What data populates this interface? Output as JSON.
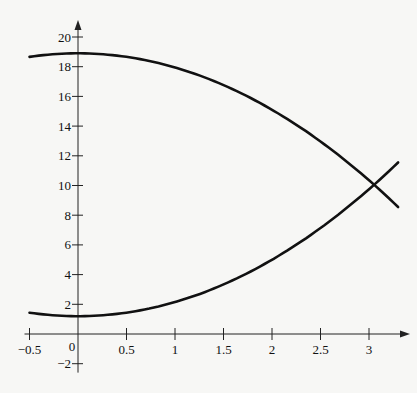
{
  "chart_data": {
    "type": "line",
    "title": "",
    "xlabel": "",
    "ylabel": "",
    "xlim": [
      -0.5,
      3.3
    ],
    "ylim": [
      -2,
      20
    ],
    "x_ticks": [
      "-0.5",
      "0",
      "0.5",
      "1",
      "1.5",
      "2",
      "2.5",
      "3"
    ],
    "y_ticks": [
      "-2",
      "2",
      "4",
      "6",
      "8",
      "10",
      "12",
      "14",
      "16",
      "18",
      "20"
    ],
    "grid": false,
    "legend": null,
    "series": [
      {
        "name": "decreasing curve",
        "x": [
          -0.5,
          0,
          0.5,
          1,
          1.5,
          2,
          2.5,
          3,
          3.3
        ],
        "y": [
          18.7,
          18.9,
          18.7,
          17.95,
          16.75,
          15.1,
          12.95,
          10.35,
          8.55
        ]
      },
      {
        "name": "increasing curve",
        "x": [
          -0.5,
          0,
          0.5,
          1,
          1.5,
          2,
          2.5,
          3,
          3.3
        ],
        "y": [
          1.44,
          1.2,
          1.44,
          2.15,
          3.34,
          5.0,
          7.14,
          9.75,
          11.55
        ]
      }
    ],
    "annotations": [
      {
        "text": "intersection",
        "x": 3.0,
        "y": 10.0
      }
    ]
  }
}
